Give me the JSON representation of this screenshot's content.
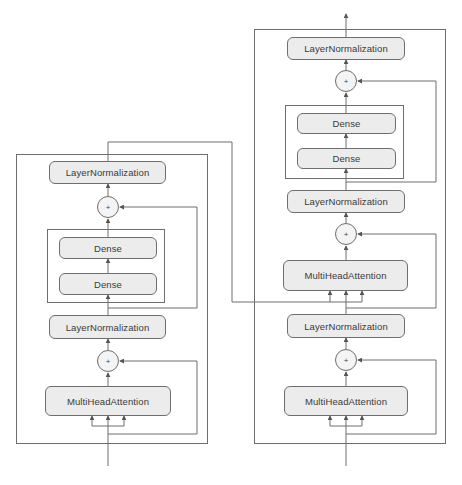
{
  "diagram": {
    "type": "transformer-encoder-decoder",
    "colors": {
      "line": "#6e6e6e",
      "node_fill": "#ececec",
      "text": "#3a3a3a"
    },
    "encoder": {
      "nodes": [
        {
          "id": "enc_ln_top",
          "label": "LayerNormalization"
        },
        {
          "id": "enc_add_top",
          "label": "+"
        },
        {
          "id": "enc_dense_1",
          "label": "Dense"
        },
        {
          "id": "enc_dense_2",
          "label": "Dense"
        },
        {
          "id": "enc_ln_mid",
          "label": "LayerNormalization"
        },
        {
          "id": "enc_add_bottom",
          "label": "+"
        },
        {
          "id": "enc_mha",
          "label": "MultiHeadAttention"
        }
      ]
    },
    "decoder": {
      "nodes": [
        {
          "id": "dec_ln_top",
          "label": "LayerNormalization"
        },
        {
          "id": "dec_add_top",
          "label": "+"
        },
        {
          "id": "dec_dense_1",
          "label": "Dense"
        },
        {
          "id": "dec_dense_2",
          "label": "Dense"
        },
        {
          "id": "dec_ln_2",
          "label": "LayerNormalization"
        },
        {
          "id": "dec_add_2",
          "label": "+"
        },
        {
          "id": "dec_cross_mha",
          "label": "MultiHeadAttention"
        },
        {
          "id": "dec_ln_3",
          "label": "LayerNormalization"
        },
        {
          "id": "dec_add_3",
          "label": "+"
        },
        {
          "id": "dec_self_mha",
          "label": "MultiHeadAttention"
        }
      ]
    }
  }
}
